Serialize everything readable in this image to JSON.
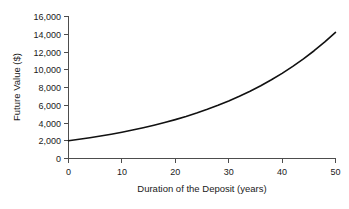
{
  "chart_data": {
    "type": "line",
    "title": "",
    "subtitle": "",
    "xlabel": "Duration of the Deposit (years)",
    "ylabel": "Future Value ($)",
    "xlim": [
      0,
      50
    ],
    "ylim": [
      0,
      16000
    ],
    "grid": false,
    "legend": null,
    "legend_position": "none",
    "x_ticks": [
      0,
      10,
      20,
      30,
      40,
      50
    ],
    "x_tick_labels": [
      "0",
      "10",
      "20",
      "30",
      "40",
      "50"
    ],
    "y_ticks": [
      0,
      2000,
      4000,
      6000,
      8000,
      10000,
      12000,
      14000,
      16000
    ],
    "y_tick_labels": [
      "0",
      "2,000",
      "4,000",
      "6,000",
      "8,000",
      "10,000",
      "12,000",
      "14,000",
      "16,000"
    ],
    "annotations": [],
    "series": [
      {
        "name": "Future Value",
        "color": "#111111",
        "x": [
          0,
          2,
          4,
          6,
          8,
          10,
          12,
          14,
          16,
          18,
          20,
          22,
          24,
          26,
          28,
          30,
          32,
          34,
          36,
          38,
          40,
          42,
          44,
          46,
          48,
          50
        ],
        "values": [
          2000,
          2163,
          2340,
          2531,
          2737,
          2960,
          3202,
          3463,
          3745,
          4050,
          4381,
          4738,
          5124,
          5542,
          5994,
          6484,
          7013,
          7585,
          8203,
          8873,
          9597,
          10380,
          11226,
          12142,
          13132,
          14202
        ]
      }
    ]
  },
  "axes": {
    "y_title": "Future Value ($)",
    "x_title": "Duration of the Deposit (years)"
  }
}
